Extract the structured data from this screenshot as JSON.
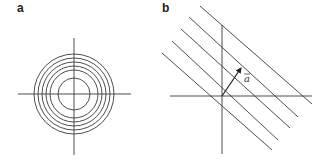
{
  "panels": [
    {
      "label": "a",
      "type": "concentric-circles",
      "center": [
        74,
        94
      ],
      "radii": [
        16,
        24,
        28,
        32,
        36,
        40
      ],
      "axes": {
        "horizontal": [
          18,
          131,
          94
        ],
        "vertical": [
          74,
          38,
          155
        ]
      }
    },
    {
      "label": "b",
      "type": "parallel-lines",
      "origin": [
        222,
        96
      ],
      "lines": [
        [
          [
            200,
            6
          ],
          [
            312,
            104
          ]
        ],
        [
          [
            189,
            17
          ],
          [
            298,
            117
          ]
        ],
        [
          [
            181,
            29
          ],
          [
            290,
            128
          ]
        ],
        [
          [
            172,
            41
          ],
          [
            278,
            140
          ]
        ],
        [
          [
            162,
            53
          ],
          [
            272,
            150
          ]
        ]
      ],
      "axes": {
        "horizontal": [
          170,
          312,
          96
        ],
        "vertical": [
          222,
          25,
          154
        ]
      },
      "vector": {
        "from": [
          222,
          96
        ],
        "to": [
          241,
          68
        ],
        "label": "a"
      }
    }
  ],
  "colors": {
    "stroke": "#3a3a3a"
  }
}
